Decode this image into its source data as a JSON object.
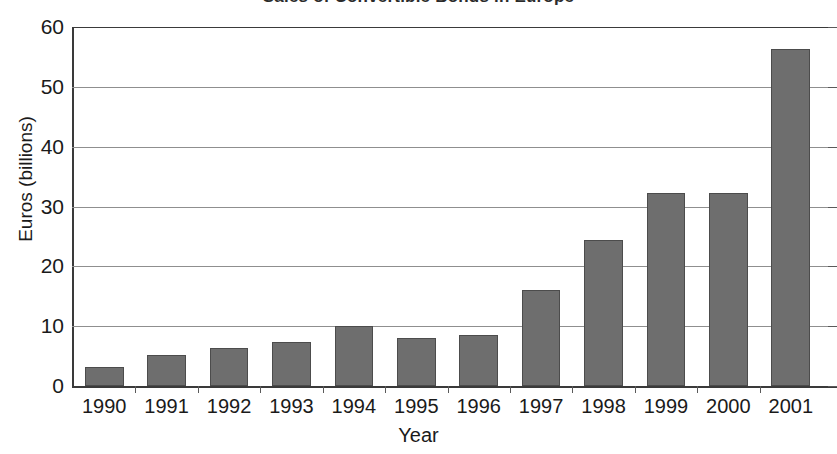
{
  "chart_data": {
    "type": "bar",
    "title": "Sales of Convertible Bonds in Europe",
    "xlabel": "Year",
    "ylabel": "Euros (billions)",
    "categories": [
      "1990",
      "1991",
      "1992",
      "1993",
      "1994",
      "1995",
      "1996",
      "1997",
      "1998",
      "1999",
      "2000",
      "2001"
    ],
    "values": [
      3.2,
      5.2,
      6.4,
      7.3,
      10.0,
      8.0,
      8.5,
      16.1,
      24.4,
      32.2,
      32.3,
      56.4
    ],
    "ylim": [
      0,
      60
    ],
    "y_ticks": [
      "0",
      "10",
      "20",
      "30",
      "40",
      "50",
      "60"
    ],
    "y_tick_values": [
      0,
      10,
      20,
      30,
      40,
      50,
      60
    ],
    "grid": true,
    "legend": "none",
    "series_color": "#6e6e6e",
    "grid_color": "#8f8f8f",
    "axis_color": "#3a3a3a"
  }
}
